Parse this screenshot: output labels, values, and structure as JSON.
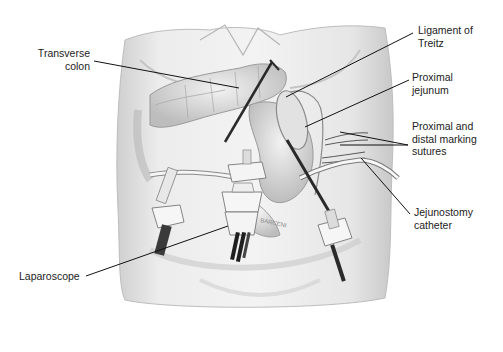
{
  "figure": {
    "colors": {
      "background": "#ffffff",
      "skin": "#e6e6e6",
      "skin_shadow": "#c9c9c9",
      "bowel": "#d8d8d8",
      "bowel_outline": "#9a9a9a",
      "instrument_dark": "#2a2a2a",
      "port_body": "#f4f4f4",
      "leader_line": "#111111",
      "label_text": "#222222"
    },
    "signature": "BARCENI"
  },
  "labels": {
    "transverse_colon": "Transverse\ncolon",
    "ligament_of_treitz": "Ligament of\nTreitz",
    "proximal_jejunum": "Proximal\njejunum",
    "marking_sutures": "Proximal and\ndistal marking\nsutures",
    "jejunostomy_catheter": "Jejunostomy\ncatheter",
    "laparoscope": "Laparoscope"
  }
}
